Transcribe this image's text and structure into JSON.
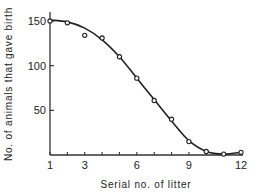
{
  "chart_data": {
    "type": "line",
    "title": "",
    "xlabel": "Serial no. of litter",
    "ylabel": "No. of animals that gave birth",
    "xlim": [
      1,
      12
    ],
    "ylim": [
      0,
      160
    ],
    "x_ticks": [
      1,
      3,
      6,
      9,
      12
    ],
    "y_ticks": [
      50,
      100,
      150
    ],
    "grid": false,
    "legend": null,
    "series": [
      {
        "name": "observed",
        "style": "open-circle markers",
        "x": [
          1,
          2,
          3,
          4,
          5,
          6,
          7,
          8,
          9,
          10,
          11,
          12
        ],
        "values": [
          150,
          148,
          134,
          131,
          110,
          86,
          61,
          40,
          15,
          4,
          1,
          3
        ]
      },
      {
        "name": "fitted curve",
        "style": "smooth solid line",
        "x": [
          1,
          2,
          3,
          4,
          5,
          6,
          7,
          8,
          9,
          10,
          11,
          12
        ],
        "values": [
          151,
          149,
          142,
          129,
          110,
          86,
          62,
          38,
          16,
          4,
          1,
          3
        ]
      }
    ]
  }
}
